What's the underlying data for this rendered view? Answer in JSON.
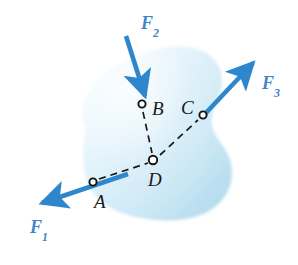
{
  "figure": {
    "canvas": {
      "width": 298,
      "height": 265
    },
    "colors": {
      "background": "#ffffff",
      "arrow_blue": "#2E87CC",
      "label_blue": "#3E86C8",
      "body_fill_light": "#F4FCFE",
      "body_fill_mid": "#CDE8F5",
      "body_fill_deep": "#B2D9EC",
      "line_dark": "#1A1A1A",
      "marker_fill": "#ffffff"
    },
    "body": {
      "name": "rigid-body-blob",
      "description": "irregular shaded plane region"
    },
    "points": [
      {
        "id": "A",
        "label": "A",
        "x": 93,
        "y": 182,
        "label_x": 94,
        "label_y": 192
      },
      {
        "id": "B",
        "label": "B",
        "x": 142,
        "y": 104,
        "label_x": 152,
        "label_y": 100
      },
      {
        "id": "C",
        "label": "C",
        "x": 203,
        "y": 115,
        "label_x": 181,
        "label_y": 99
      },
      {
        "id": "D",
        "label": "D",
        "x": 153,
        "y": 160,
        "label_x": 148,
        "label_y": 170
      }
    ],
    "construction_lines": [
      {
        "name": "line-A-D",
        "from": "A",
        "to": "D",
        "style": "dashed"
      },
      {
        "name": "line-B-D",
        "from": "B",
        "to": "D",
        "style": "dashed"
      },
      {
        "name": "line-D-C",
        "from": "D",
        "to": "C",
        "style": "dashed"
      }
    ],
    "forces": [
      {
        "id": "F1",
        "label": "F",
        "subscript": "1",
        "applied_at": "A",
        "direction": "down-left",
        "tail_x": 128,
        "tail_y": 174,
        "tip_x": 33,
        "tip_y": 206,
        "label_x": 30,
        "label_y": 218
      },
      {
        "id": "F2",
        "label": "F",
        "subscript": "2",
        "applied_at": "B",
        "direction": "down-right",
        "tail_x": 126,
        "tail_y": 36,
        "tip_x": 145,
        "tip_y": 100,
        "label_x": 141,
        "label_y": 14
      },
      {
        "id": "F3",
        "label": "F",
        "subscript": "3",
        "applied_at": "C",
        "direction": "up-right",
        "tail_x": 203,
        "tail_y": 116,
        "tip_x": 259,
        "tip_y": 57,
        "label_x": 262,
        "label_y": 75
      }
    ]
  }
}
